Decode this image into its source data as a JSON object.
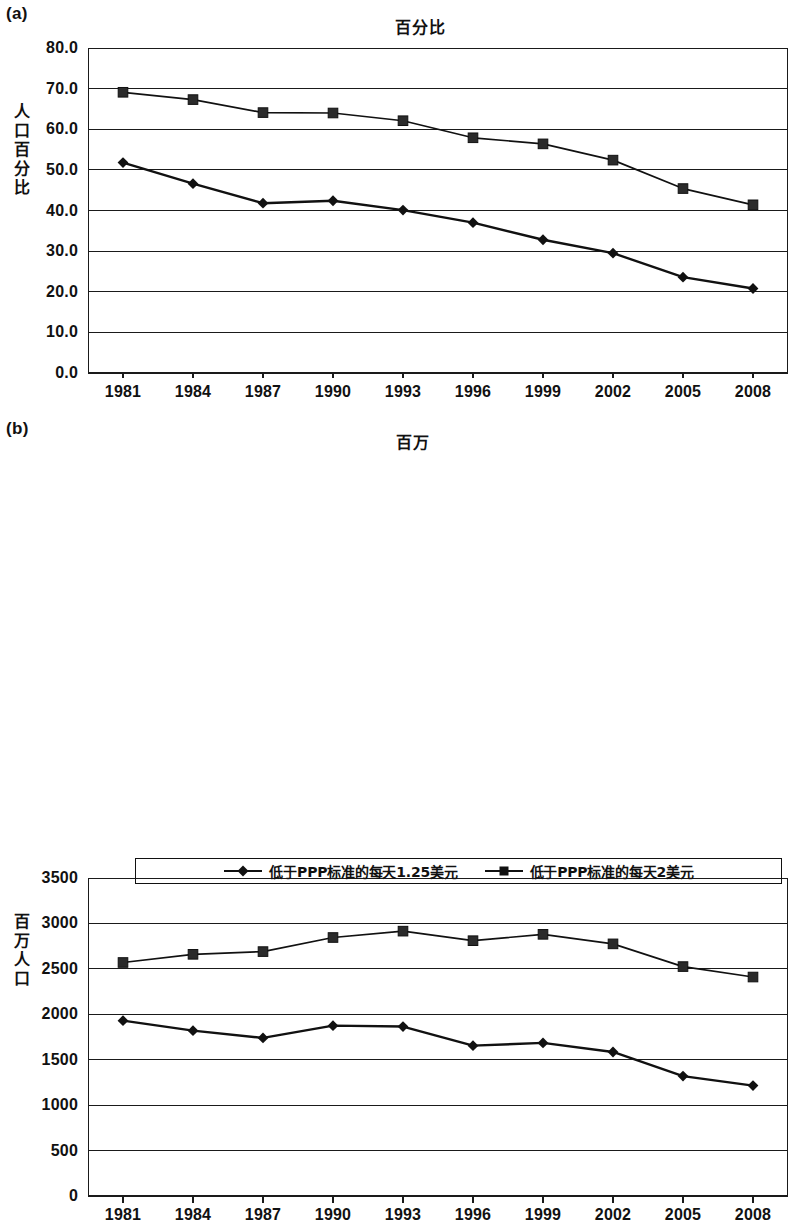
{
  "figure": {
    "panels": [
      {
        "tag": "(a)",
        "title": "百分比",
        "ylabel": "人口百分比"
      },
      {
        "tag": "(b)",
        "title": "百万",
        "ylabel": "百万人口"
      }
    ]
  },
  "legend": {
    "entries": [
      {
        "label": "低于PPP标准的每天1.25美元",
        "marker": "diamond-marker-icon"
      },
      {
        "label": "低于PPP标准的每天2美元",
        "marker": "square-marker-icon"
      }
    ]
  },
  "chart_data": [
    {
      "type": "line",
      "panel": "(a)",
      "title": "百分比",
      "xlabel": "",
      "ylabel": "人口百分比",
      "categories": [
        "1981",
        "1984",
        "1987",
        "1990",
        "1993",
        "1996",
        "1999",
        "2002",
        "2005",
        "2008"
      ],
      "ylim": [
        0.0,
        80.0
      ],
      "yticks": [
        "0.0",
        "10.0",
        "20.0",
        "30.0",
        "40.0",
        "50.0",
        "60.0",
        "70.0",
        "80.0"
      ],
      "ytick_values": [
        0.0,
        10.0,
        20.0,
        30.0,
        40.0,
        50.0,
        60.0,
        70.0,
        80.0
      ],
      "grid": true,
      "legend_position": "bottom",
      "series": [
        {
          "name": "低于PPP标准的每天1.25美元",
          "marker": "diamond",
          "values": [
            51.8,
            46.6,
            41.8,
            42.4,
            40.1,
            37.0,
            32.8,
            29.5,
            23.6,
            20.8
          ]
        },
        {
          "name": "低于PPP标准的每天2美元",
          "marker": "square",
          "values": [
            69.1,
            67.3,
            64.1,
            64.0,
            62.1,
            57.9,
            56.4,
            52.4,
            45.4,
            41.4
          ]
        }
      ]
    },
    {
      "type": "line",
      "panel": "(b)",
      "title": "百万",
      "xlabel": "",
      "ylabel": "百万人口",
      "categories": [
        "1981",
        "1984",
        "1987",
        "1990",
        "1993",
        "1996",
        "1999",
        "2002",
        "2005",
        "2008"
      ],
      "ylim": [
        0,
        3500
      ],
      "yticks": [
        "0",
        "500",
        "1000",
        "1500",
        "2000",
        "2500",
        "3000",
        "3500"
      ],
      "ytick_values": [
        0,
        500,
        1000,
        1500,
        2000,
        2500,
        3000,
        3500
      ],
      "grid": true,
      "legend_position": "bottom",
      "series": [
        {
          "name": "低于PPP标准的每天1.25美元",
          "marker": "diamond",
          "values": [
            1930,
            1820,
            1740,
            1875,
            1865,
            1655,
            1685,
            1585,
            1320,
            1215
          ]
        },
        {
          "name": "低于PPP标准的每天2美元",
          "marker": "square",
          "values": [
            2570,
            2660,
            2690,
            2845,
            2915,
            2810,
            2880,
            2775,
            2525,
            2410
          ]
        }
      ]
    }
  ]
}
